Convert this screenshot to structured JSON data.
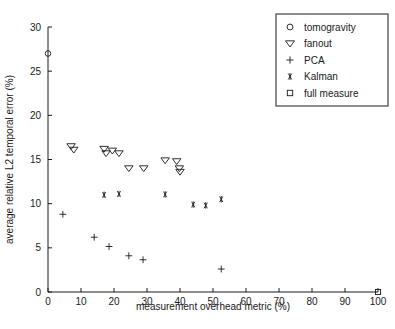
{
  "chart_data": {
    "type": "scatter",
    "title": "",
    "xlabel": "measurement overhead metric (%)",
    "ylabel": "average relative L2 temporal error (%)",
    "xlim": [
      0,
      100
    ],
    "ylim": [
      0,
      30
    ],
    "xticks": [
      0,
      10,
      20,
      30,
      40,
      50,
      60,
      70,
      80,
      90,
      100
    ],
    "yticks": [
      0,
      5,
      10,
      15,
      20,
      25,
      30
    ],
    "grid": false,
    "legend_position": "top-right",
    "series": [
      {
        "name": "tomogravity",
        "marker": "circle",
        "points": [
          [
            0,
            27.0
          ]
        ]
      },
      {
        "name": "fanout",
        "marker": "triangle-down",
        "points": [
          [
            7.0,
            16.5
          ],
          [
            7.8,
            16.1
          ],
          [
            17.0,
            16.2
          ],
          [
            17.6,
            15.7
          ],
          [
            19.5,
            16.0
          ],
          [
            21.5,
            15.7
          ],
          [
            24.5,
            14.0
          ],
          [
            29.0,
            14.0
          ],
          [
            35.5,
            14.9
          ],
          [
            39.0,
            14.8
          ],
          [
            39.8,
            14.0
          ],
          [
            40.0,
            13.6
          ]
        ]
      },
      {
        "name": "PCA",
        "marker": "plus",
        "points": [
          [
            4.5,
            8.8
          ],
          [
            14.0,
            6.2
          ],
          [
            18.5,
            5.15
          ],
          [
            24.5,
            4.1
          ],
          [
            28.8,
            3.65
          ],
          [
            52.5,
            2.6
          ]
        ]
      },
      {
        "name": "Kalman",
        "marker": "asterisk",
        "points": [
          [
            17.0,
            11.0
          ],
          [
            21.5,
            11.1
          ],
          [
            35.5,
            11.05
          ],
          [
            44.0,
            9.9
          ],
          [
            47.8,
            9.8
          ],
          [
            52.5,
            10.5
          ]
        ]
      },
      {
        "name": "full measure",
        "marker": "square",
        "points": [
          [
            100,
            0
          ]
        ]
      }
    ],
    "legend": [
      {
        "label": "tomogravity",
        "marker": "circle"
      },
      {
        "label": "fanout",
        "marker": "triangle-down"
      },
      {
        "label": "PCA",
        "marker": "plus"
      },
      {
        "label": "Kalman",
        "marker": "asterisk"
      },
      {
        "label": "full measure",
        "marker": "square"
      }
    ]
  }
}
